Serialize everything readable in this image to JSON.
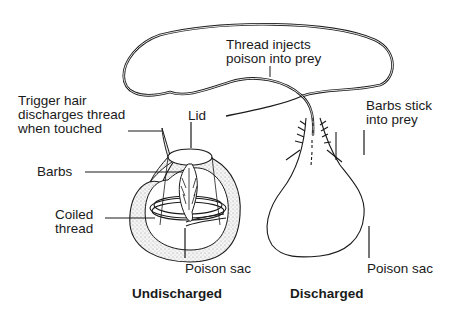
{
  "diagram": {
    "labels": {
      "thread_injects": "Thread injects\npoison into prey",
      "trigger_hair": "Trigger hair\ndischarges thread\nwhen touched",
      "lid": "Lid",
      "barbs": "Barbs",
      "coiled_thread": "Coiled\nthread",
      "poison_sac_left": "Poison sac",
      "barbs_stick": "Barbs stick\ninto prey",
      "poison_sac_right": "Poison sac"
    },
    "captions": {
      "undischarged": "Undischarged",
      "discharged": "Discharged"
    },
    "colors": {
      "line": "#1a1a1a",
      "stipple": "#cfcfcf",
      "background": "#ffffff"
    }
  }
}
